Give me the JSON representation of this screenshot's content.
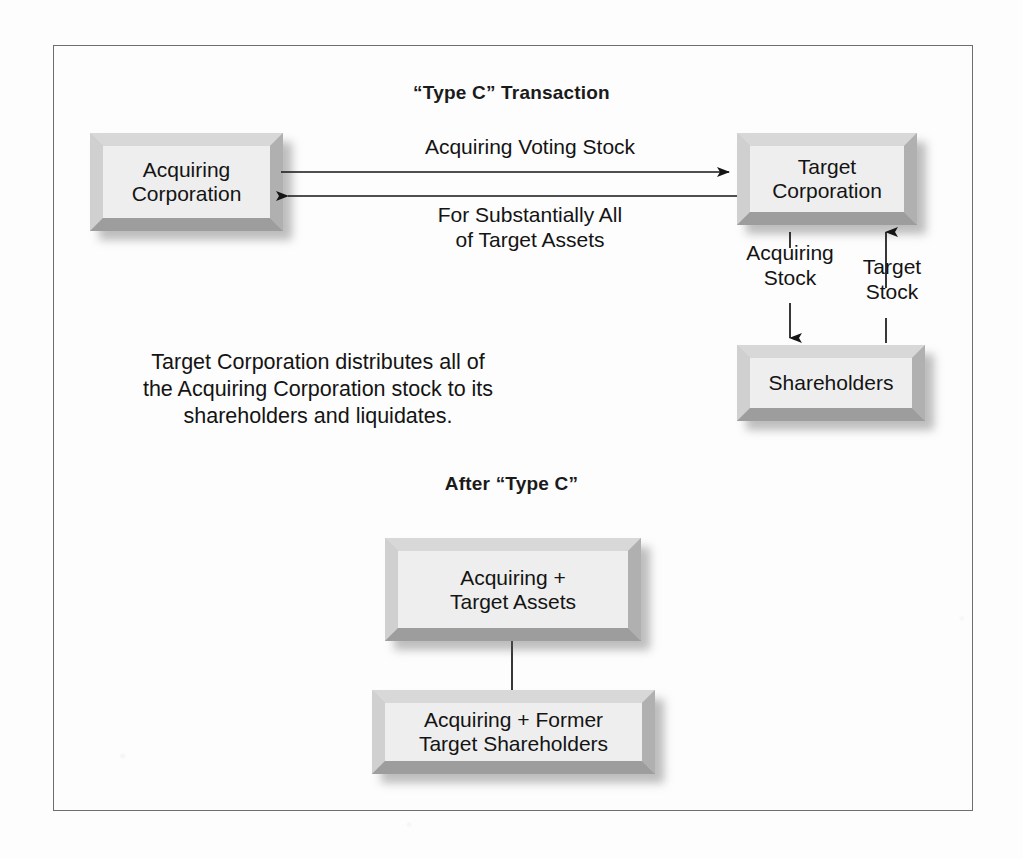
{
  "diagram": {
    "section_top": {
      "title": "“Type C” Transaction",
      "boxes": {
        "acquiring": "Acquiring\nCorporation",
        "target": "Target\nCorporation",
        "shareholders": "Shareholders"
      },
      "arrow_labels": {
        "to_target": "Acquiring Voting Stock",
        "to_acquiring": "For Substantially All\nof Target Assets",
        "acquiring_stock": "Acquiring\nStock",
        "target_stock": "Target\nStock"
      },
      "note": "Target Corporation distributes all of\nthe Acquiring Corporation stock to its\nshareholders and liquidates."
    },
    "section_bottom": {
      "title": "After “Type C”",
      "boxes": {
        "combined_assets": "Acquiring +\nTarget Assets",
        "combined_shareholders": "Acquiring + Former\nTarget Shareholders"
      }
    }
  },
  "colors": {
    "box_fill": "#eeeeee",
    "bevel_light": "#d8d8d8",
    "bevel_dark": "#9d9d9d",
    "line": "#151515",
    "frame": "#6e6e72",
    "text": "#141414",
    "page": "#fdfdfd"
  }
}
